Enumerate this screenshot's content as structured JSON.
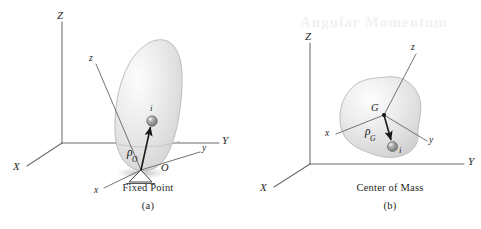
{
  "figure": {
    "kind": "engineering-mechanics-diagram",
    "background_color": "#ffffff",
    "ink_color": "#4a4a4a",
    "body_fill_color": "#e3e3e3",
    "body_edge_color": "#b5b5b5",
    "particle_color": "#8f8f8f"
  },
  "panels": [
    {
      "id": "a",
      "caption_title": "Fixed Point",
      "caption_number": "(a)",
      "fixed_axes": [
        {
          "name": "Z",
          "label": "Z"
        },
        {
          "name": "X",
          "label": "X"
        },
        {
          "name": "Y",
          "label": "Y"
        }
      ],
      "body_axes": [
        {
          "name": "z",
          "label": "z"
        },
        {
          "name": "x",
          "label": "x"
        },
        {
          "name": "y",
          "label": "y"
        }
      ],
      "origin_label": "O",
      "particle_label": "i",
      "vector": {
        "symbol": "ρ",
        "subscript": "O",
        "from": "O",
        "to": "i"
      },
      "support": "pin-support-triangle"
    },
    {
      "id": "b",
      "caption_title": "Center of Mass",
      "caption_number": "(b)",
      "fixed_axes": [
        {
          "name": "Z",
          "label": "Z"
        },
        {
          "name": "X",
          "label": "X"
        },
        {
          "name": "Y",
          "label": "Y"
        }
      ],
      "body_axes": [
        {
          "name": "z",
          "label": "z"
        },
        {
          "name": "x",
          "label": "x"
        },
        {
          "name": "y",
          "label": "y"
        }
      ],
      "origin_label": "G",
      "particle_label": "i",
      "vector": {
        "symbol": "ρ",
        "subscript": "G",
        "from": "G",
        "to": "i"
      },
      "support": "none"
    }
  ],
  "artifacts": {
    "bleed_through_text": "Angular Momentum"
  }
}
